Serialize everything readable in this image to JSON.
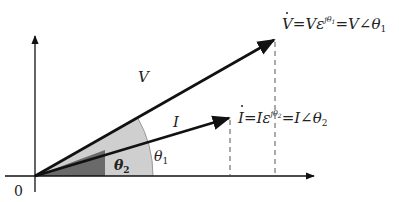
{
  "diagram": {
    "type": "phasor-diagram",
    "origin_label": "0",
    "vectors": [
      {
        "name": "V",
        "label": "V",
        "angle_label": "θ",
        "angle_sub": "1",
        "color": "#111111"
      },
      {
        "name": "I",
        "label": "I",
        "angle_label": "θ",
        "angle_sub": "2",
        "color": "#111111"
      }
    ],
    "equations": {
      "voltage": {
        "lhs": "V",
        "eq1": "=V",
        "eps": "ε",
        "exp": "jθ",
        "exp_sub": "1",
        "eq2": "=V∠θ",
        "sub": "1"
      },
      "current": {
        "lhs": "I",
        "eq1": "=I",
        "eps": "ε",
        "exp": "jθ",
        "exp_sub": "2",
        "eq2": "=I∠θ",
        "sub": "2"
      }
    },
    "colors": {
      "theta1_fill": "#cfcfcf",
      "theta2_fill": "#6a6a6a",
      "axis": "#111111",
      "dashed": "#555555"
    }
  }
}
